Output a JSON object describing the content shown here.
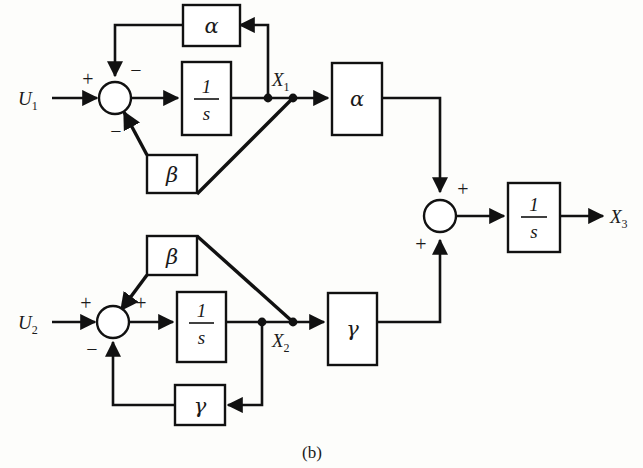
{
  "figure": {
    "caption": "(b)",
    "type": "control-system-block-diagram"
  },
  "signals": {
    "u1": "U",
    "u1_sub": "1",
    "u2": "U",
    "u2_sub": "2",
    "x1": "X",
    "x1_sub": "1",
    "x2": "X",
    "x2_sub": "2",
    "x3": "X",
    "x3_sub": "3"
  },
  "blocks": {
    "alpha_feedback_top": "α",
    "integrator_1_num": "1",
    "integrator_1_den": "s",
    "beta_upper": "β",
    "beta_lower": "β",
    "integrator_2_num": "1",
    "integrator_2_den": "s",
    "gamma_feedback_bottom": "γ",
    "alpha_forward": "α",
    "gamma_forward": "γ",
    "integrator_3_num": "1",
    "integrator_3_den": "s"
  },
  "summing_junctions": {
    "sum_top": {
      "sign_left": "+",
      "sign_top": "−",
      "sign_bottom": "−"
    },
    "sum_bottom": {
      "sign_left": "+",
      "sign_top": "+",
      "sign_bottom": "−"
    },
    "sum_right": {
      "sign_top": "+",
      "sign_bottom": "+"
    }
  },
  "colors": {
    "line": "#111111",
    "fill": "#ffffff",
    "background": "#fdfdfb"
  }
}
